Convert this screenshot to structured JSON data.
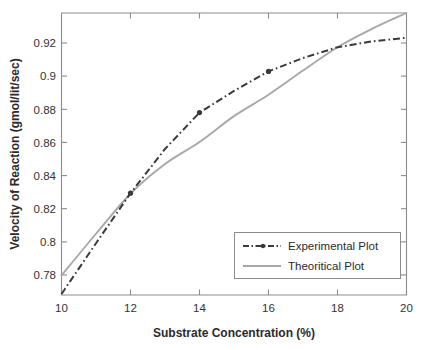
{
  "chart_data": {
    "type": "line",
    "title": "",
    "xlabel": "Substrate Concentration (%)",
    "ylabel": "Velocity of Reaction (gmol/lit/sec)",
    "xlim": [
      10,
      20
    ],
    "ylim": [
      0.7655,
      0.9345
    ],
    "xticks": [
      10,
      12,
      14,
      16,
      18,
      20
    ],
    "xticklabels": [
      "10",
      "12",
      "14",
      "16",
      "18",
      "20"
    ],
    "yticks": [
      0.78,
      0.8,
      0.82,
      0.84,
      0.86,
      0.88,
      0.9,
      0.92
    ],
    "yticklabels": [
      "0.78",
      "0.8",
      "0.82",
      "0.84",
      "0.86",
      "0.88",
      "0.9",
      "0.92"
    ],
    "grid": false,
    "legend_position": "lower right",
    "series": [
      {
        "name": "Experimental Plot",
        "style": "dash-dot",
        "color": "#3a3a3a",
        "x": [
          10,
          11,
          12,
          13,
          14,
          15,
          16,
          17,
          18,
          19,
          20
        ],
        "values": [
          0.7661,
          0.7965,
          0.8265,
          0.853,
          0.8748,
          0.8878,
          0.8995,
          0.9075,
          0.914,
          0.9175,
          0.9197
        ]
      },
      {
        "name": "Theoritical Plot",
        "style": "solid",
        "color": "#a8a8a8",
        "x": [
          10,
          11,
          12,
          13,
          14,
          15,
          16,
          17,
          18,
          19,
          20
        ],
        "values": [
          0.7772,
          0.8022,
          0.8262,
          0.844,
          0.8572,
          0.8727,
          0.8855,
          0.9,
          0.914,
          0.925,
          0.9345
        ]
      }
    ]
  },
  "legend": {
    "items": [
      {
        "label": "Experimental Plot",
        "swatch": "dash-dot-line-swatch"
      },
      {
        "label": "Theoritical Plot",
        "swatch": "solid-line-swatch"
      }
    ]
  },
  "axes": {
    "x_title": "Substrate Concentration (%)",
    "y_title": "Velocity of Reaction (gmol/lit/sec)"
  }
}
